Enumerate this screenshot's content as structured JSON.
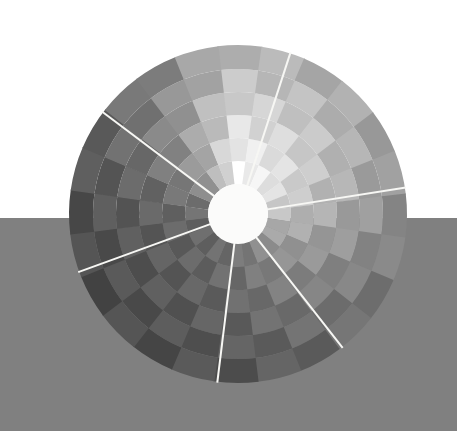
{
  "scene": {
    "width": 457,
    "height": 431,
    "title": "Radial segmented color wheel on split background"
  },
  "background": {
    "sky_color": "#ffffff",
    "ground_color": "#808080",
    "horizon_y": 218,
    "sky_label": "upper white backdrop",
    "ground_label": "lower gray surface"
  },
  "chart_data": {
    "type": "pie",
    "subtitle": "Polar grid of 24 angular sectors by 6 concentric rings",
    "center_x": 238,
    "center_y": 214,
    "outer_radius": 169,
    "inner_radius": 30,
    "hub_color": "#fbfbfa",
    "ring_count": 6,
    "sector_count": 24,
    "divider_color": "#f7f7f4",
    "divider_width": 2.0,
    "grid": false,
    "legend": "none",
    "xlabel": "",
    "ylabel": "",
    "angle_offset_deg": -97,
    "ring_radii": [
      30,
      53,
      76,
      99,
      122,
      145,
      169
    ],
    "ring_falloff": [
      1.0,
      0.955,
      0.9,
      0.845,
      0.79,
      0.735
    ],
    "sector_values": [
      0.97,
      0.95,
      0.93,
      0.9,
      0.86,
      0.81,
      0.75,
      0.69,
      0.63,
      0.58,
      0.53,
      0.49,
      0.455,
      0.43,
      0.415,
      0.405,
      0.4,
      0.405,
      0.425,
      0.46,
      0.52,
      0.6,
      0.71,
      0.85
    ],
    "sector_labels": [
      "s01",
      "s02",
      "s03",
      "s04",
      "s05",
      "s06",
      "s07",
      "s08",
      "s09",
      "s10",
      "s11",
      "s12",
      "s13",
      "s14",
      "s15",
      "s16",
      "s17",
      "s18",
      "s19",
      "s20",
      "s21",
      "s22",
      "s23",
      "s24"
    ],
    "checker_delta": 0.035,
    "spokes": [
      {
        "name": "spoke-top-right",
        "angle_deg": -72
      },
      {
        "name": "spoke-upper-left",
        "angle_deg": -143
      },
      {
        "name": "spoke-left",
        "angle_deg": 160
      },
      {
        "name": "spoke-bottom",
        "angle_deg": 97
      },
      {
        "name": "spoke-lower-right",
        "angle_deg": 52
      },
      {
        "name": "spoke-right",
        "angle_deg": -9
      }
    ]
  }
}
